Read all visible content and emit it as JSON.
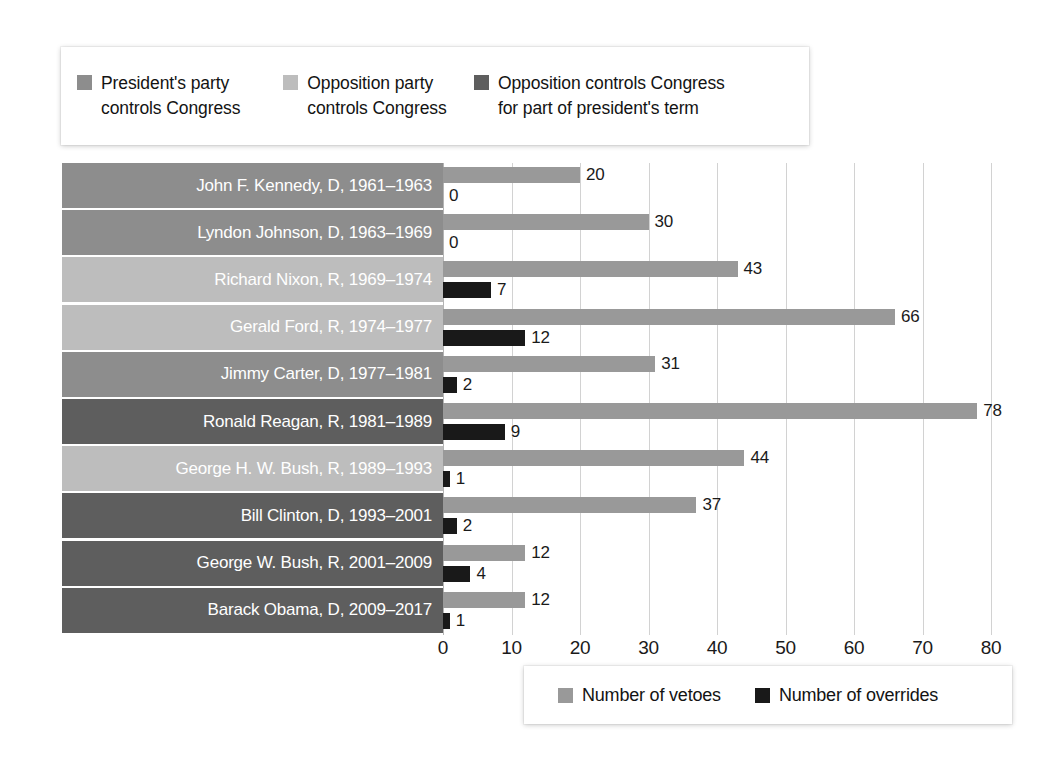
{
  "chart_data": {
    "type": "bar",
    "orientation": "horizontal",
    "title": "",
    "xlabel": "",
    "ylabel": "",
    "xlim": [
      0,
      80
    ],
    "xticks": [
      0,
      10,
      20,
      30,
      40,
      50,
      60,
      70,
      80
    ],
    "grid": true,
    "grid_axis": "x",
    "categories": [
      "John F. Kennedy, D, 1961–1963",
      "Lyndon Johnson, D, 1963–1969",
      "Richard Nixon, R, 1969–1974",
      "Gerald Ford, R, 1974–1977",
      "Jimmy Carter, D, 1977–1981",
      "Ronald Reagan, R, 1981–1989",
      "George H. W. Bush, R, 1989–1993",
      "Bill Clinton, D, 1993–2001",
      "George W. Bush, R, 2001–2009",
      "Barack Obama, D, 2009–2017"
    ],
    "series": [
      {
        "name": "Number of vetoes",
        "color": "#999999",
        "values": [
          20,
          30,
          43,
          66,
          31,
          78,
          44,
          37,
          12,
          12
        ]
      },
      {
        "name": "Number of overrides",
        "color": "#191919",
        "values": [
          0,
          0,
          7,
          12,
          2,
          9,
          1,
          2,
          4,
          1
        ]
      }
    ],
    "category_control": [
      "presidents-party",
      "presidents-party",
      "opposition-party",
      "opposition-party",
      "presidents-party",
      "opposition-partial",
      "opposition-party",
      "opposition-partial",
      "opposition-partial",
      "opposition-partial"
    ]
  },
  "colors": {
    "presidents_party": "#8d8d8d",
    "opposition_party": "#bdbdbd",
    "opposition_partial": "#5e5e5e",
    "veto_bar": "#999999",
    "override_bar": "#191919",
    "gridline": "#d2d2d2",
    "label_text": "#ffffff",
    "value_text": "#1a1a1a"
  },
  "top_legend": {
    "entries": [
      {
        "swatch_color": "#8d8d8d",
        "line1": "President's party",
        "line2": "controls Congress"
      },
      {
        "swatch_color": "#bdbdbd",
        "line1": "Opposition party",
        "line2": "controls Congress"
      },
      {
        "swatch_color": "#5e5e5e",
        "line1": "Opposition controls Congress",
        "line2": "for part of president's term"
      }
    ]
  },
  "bottom_legend": {
    "entries": [
      {
        "swatch_color": "#999999",
        "label": "Number of vetoes"
      },
      {
        "swatch_color": "#191919",
        "label": "Number of overrides"
      }
    ]
  },
  "x_axis": {
    "ticks": [
      "0",
      "10",
      "20",
      "30",
      "40",
      "50",
      "60",
      "70",
      "80"
    ]
  },
  "rows": [
    {
      "label": "John F. Kennedy, D, 1961–1963",
      "control": "presidents-party",
      "band_color": "#8d8d8d",
      "veto": 20,
      "veto_label": "20",
      "override": 0,
      "override_label": "0"
    },
    {
      "label": "Lyndon Johnson, D, 1963–1969",
      "control": "presidents-party",
      "band_color": "#8d8d8d",
      "veto": 30,
      "veto_label": "30",
      "override": 0,
      "override_label": "0"
    },
    {
      "label": "Richard Nixon, R, 1969–1974",
      "control": "opposition-party",
      "band_color": "#bdbdbd",
      "veto": 43,
      "veto_label": "43",
      "override": 7,
      "override_label": "7"
    },
    {
      "label": "Gerald Ford, R, 1974–1977",
      "control": "opposition-party",
      "band_color": "#bdbdbd",
      "veto": 66,
      "veto_label": "66",
      "override": 12,
      "override_label": "12"
    },
    {
      "label": "Jimmy Carter, D, 1977–1981",
      "control": "presidents-party",
      "band_color": "#8d8d8d",
      "veto": 31,
      "veto_label": "31",
      "override": 2,
      "override_label": "2"
    },
    {
      "label": "Ronald Reagan, R, 1981–1989",
      "control": "opposition-partial",
      "band_color": "#5e5e5e",
      "veto": 78,
      "veto_label": "78",
      "override": 9,
      "override_label": "9"
    },
    {
      "label": "George H. W. Bush, R, 1989–1993",
      "control": "opposition-party",
      "band_color": "#bdbdbd",
      "veto": 44,
      "veto_label": "44",
      "override": 1,
      "override_label": "1"
    },
    {
      "label": "Bill Clinton, D, 1993–2001",
      "control": "opposition-partial",
      "band_color": "#5e5e5e",
      "veto": 37,
      "veto_label": "37",
      "override": 2,
      "override_label": "2"
    },
    {
      "label": "George W. Bush, R, 2001–2009",
      "control": "opposition-partial",
      "band_color": "#5e5e5e",
      "veto": 12,
      "veto_label": "12",
      "override": 4,
      "override_label": "4"
    },
    {
      "label": "Barack Obama, D, 2009–2017",
      "control": "opposition-partial",
      "band_color": "#5e5e5e",
      "veto": 12,
      "veto_label": "12",
      "override": 1,
      "override_label": "1"
    }
  ]
}
